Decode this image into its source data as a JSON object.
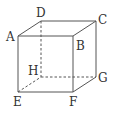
{
  "diagram": {
    "type": "cube",
    "vertices": {
      "A": {
        "label": "A",
        "x": 18,
        "y": 36
      },
      "B": {
        "label": "B",
        "x": 73,
        "y": 35
      },
      "C": {
        "label": "C",
        "x": 96,
        "y": 20
      },
      "D": {
        "label": "D",
        "x": 41,
        "y": 21
      },
      "E": {
        "label": "E",
        "x": 18,
        "y": 92
      },
      "F": {
        "label": "F",
        "x": 73,
        "y": 92
      },
      "G": {
        "label": "G",
        "x": 96,
        "y": 77
      },
      "H": {
        "label": "H",
        "x": 41,
        "y": 77
      }
    },
    "visible_edges": [
      "AB",
      "BC",
      "CD",
      "DA",
      "AE",
      "BF",
      "CG",
      "EF",
      "FG"
    ],
    "hidden_edges": [
      "DH",
      "EH",
      "HG"
    ],
    "colors": {
      "edge": "#555555",
      "label": "#333333",
      "background": "#ffffff"
    }
  }
}
